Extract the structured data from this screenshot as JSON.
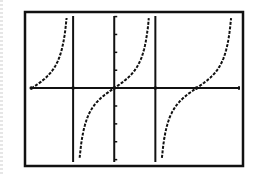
{
  "chart_data": {
    "type": "line",
    "title": "",
    "xlabel": "",
    "ylabel": "",
    "function": "y = tan(x)",
    "xlim": [
      -3.37,
      4.88
    ],
    "ylim": [
      -4.3,
      4.2
    ],
    "grid": false,
    "legend": null,
    "y_tick_step": 1,
    "y_ticks": [
      -4,
      -3,
      -2,
      -1,
      1,
      2,
      3,
      4
    ],
    "x_intercepts": [
      -3.1416,
      0,
      3.1416
    ],
    "asymptotes": [
      -1.5708,
      1.5708
    ],
    "series": [
      {
        "name": "tan(x)",
        "style": "dotted",
        "color": "#111111"
      }
    ]
  },
  "colors": {
    "frame": "#111111",
    "axis": "#111111",
    "curve": "#111111",
    "background": "#ffffff"
  }
}
